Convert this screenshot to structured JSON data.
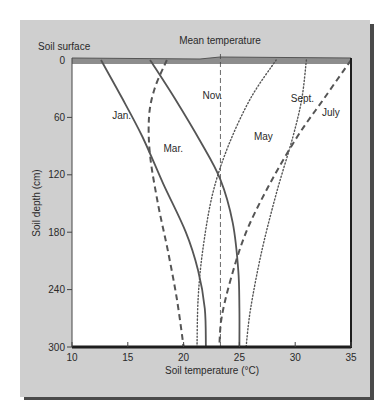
{
  "chart_data": {
    "type": "line",
    "title": "",
    "xlabel": "Soil temperature (°C)",
    "ylabel": "Soil depth (cm)",
    "xlim": [
      10,
      35
    ],
    "ylim": [
      300,
      0
    ],
    "x_ticks": [
      10,
      15,
      20,
      25,
      30,
      35
    ],
    "y_ticks": [
      0,
      60,
      120,
      180,
      240,
      300
    ],
    "grid": false,
    "annotations": [
      {
        "text": "Soil surface",
        "position": "top-left above axis"
      },
      {
        "text": "Mean temperature",
        "position": "above mean line",
        "x": 23.3
      }
    ],
    "mean_temperature": 23.3,
    "series": [
      {
        "name": "Jan.",
        "style": "solid",
        "points": [
          [
            12.6,
            0
          ],
          [
            14.5,
            40
          ],
          [
            16.3,
            80
          ],
          [
            18.2,
            130
          ],
          [
            20.2,
            180
          ],
          [
            21.3,
            220
          ],
          [
            21.9,
            260
          ],
          [
            22.0,
            300
          ]
        ]
      },
      {
        "name": "Mar.",
        "style": "dashed",
        "points": [
          [
            18.5,
            0
          ],
          [
            17.4,
            30
          ],
          [
            16.9,
            60
          ],
          [
            17.0,
            100
          ],
          [
            17.7,
            150
          ],
          [
            18.6,
            200
          ],
          [
            19.4,
            250
          ],
          [
            20.0,
            300
          ]
        ]
      },
      {
        "name": "Nov.",
        "style": "solid",
        "points": [
          [
            17.0,
            0
          ],
          [
            19.2,
            40
          ],
          [
            21.5,
            85
          ],
          [
            23.3,
            125
          ],
          [
            24.4,
            170
          ],
          [
            24.9,
            220
          ],
          [
            25.0,
            260
          ],
          [
            25.0,
            300
          ]
        ]
      },
      {
        "name": "May",
        "style": "dotted",
        "points": [
          [
            28.3,
            0
          ],
          [
            26.0,
            40
          ],
          [
            24.0,
            90
          ],
          [
            22.6,
            140
          ],
          [
            21.7,
            200
          ],
          [
            21.3,
            250
          ],
          [
            21.2,
            300
          ]
        ]
      },
      {
        "name": "Sept.",
        "style": "dotted",
        "points": [
          [
            31.0,
            0
          ],
          [
            30.6,
            40
          ],
          [
            29.8,
            80
          ],
          [
            28.3,
            140
          ],
          [
            27.0,
            200
          ],
          [
            26.0,
            260
          ],
          [
            25.6,
            300
          ]
        ]
      },
      {
        "name": "July",
        "style": "dashed",
        "points": [
          [
            35.0,
            0
          ],
          [
            32.6,
            40
          ],
          [
            30.2,
            80
          ],
          [
            27.7,
            130
          ],
          [
            25.6,
            180
          ],
          [
            24.2,
            230
          ],
          [
            23.4,
            270
          ],
          [
            23.2,
            300
          ]
        ]
      }
    ]
  },
  "labels": {
    "soil_surface": "Soil surface",
    "mean_temperature": "Mean temperature",
    "xlabel": "Soil temperature (°C)",
    "ylabel": "Soil depth (cm)",
    "series_labels": [
      {
        "name": "Jan.",
        "x": 13.6,
        "y": 62
      },
      {
        "name": "Mar.",
        "x": 18.2,
        "y": 96
      },
      {
        "name": "Nov.",
        "x": 21.7,
        "y": 41
      },
      {
        "name": "May",
        "x": 26.3,
        "y": 84
      },
      {
        "name": "Sept.",
        "x": 29.6,
        "y": 44
      },
      {
        "name": "July",
        "x": 32.4,
        "y": 59
      }
    ]
  }
}
